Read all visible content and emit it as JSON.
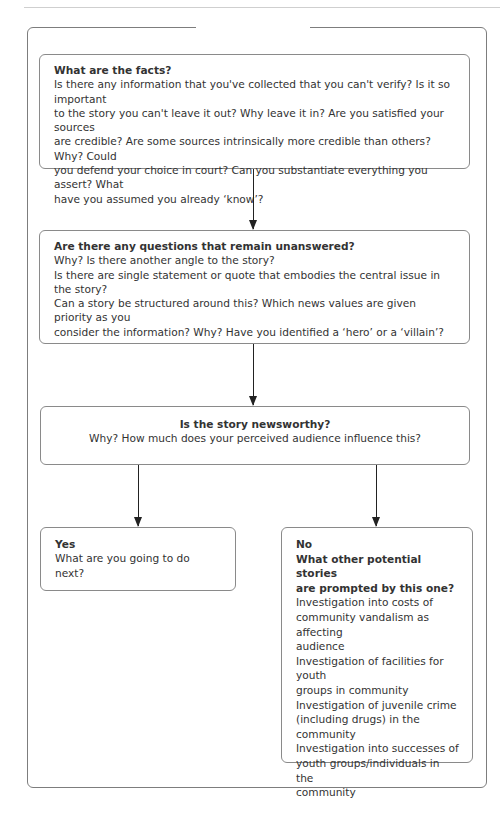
{
  "flowchart": {
    "facts": {
      "title": "What are the facts?",
      "lines": [
        "Is there any information that you've collected that you can't verify? Is it so important",
        "to the story you can't leave it out? Why leave it in? Are you satisfied your sources",
        "are credible? Are some sources intrinsically more credible than others? Why? Could",
        "you defend your choice in court? Can you substantiate everything you assert? What",
        "have you assumed you already ‘know’?"
      ]
    },
    "questions": {
      "title": "Are there any questions that remain unanswered?",
      "lines": [
        "Why? Is there another angle to the story?",
        "Is there are single statement or quote that embodies the central issue in the story?",
        "Can a story be structured around this? Which news values are given priority as you",
        "consider the information? Why? Have you identified a ‘hero’ or a ‘villain’?"
      ]
    },
    "newsworthy": {
      "title": "Is the story newsworthy?",
      "lines": [
        "Why? How much does your perceived audience influence this?"
      ]
    },
    "yes": {
      "title": "Yes",
      "lines": [
        "What are you going to do next?"
      ]
    },
    "no": {
      "title": "No",
      "subtitle_lines": [
        "What other potential stories",
        "are prompted by this one?"
      ],
      "lines": [
        "Investigation into costs of",
        "community vandalism as affecting",
        "audience",
        "Investigation of facilities for youth",
        "groups in community",
        "Investigation of juvenile crime",
        "(including drugs) in the",
        "community",
        "Investigation into successes of",
        "youth groups/individuals in the",
        "community"
      ]
    }
  }
}
